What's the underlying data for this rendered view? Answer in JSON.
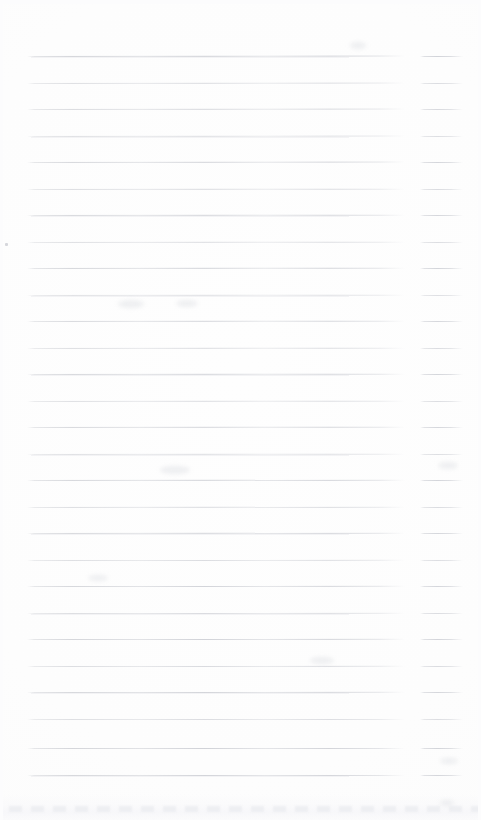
{
  "document": {
    "kind": "scanned-page",
    "description": "Blank ruled notepad page, scanned",
    "page_width": 481,
    "page_height": 820,
    "text_content": "",
    "visible_text": []
  },
  "paper": {
    "background_color": "#fdfdfd",
    "edge_color": "#fcfcfc"
  },
  "ruling": {
    "line_color": "#c9cbd1",
    "ghost_color": "#e2e4e8",
    "line_thickness_px": 1,
    "line_count": 28,
    "first_line_y": 56,
    "line_spacing_px": 26.6,
    "main_segment": {
      "x_start": 27,
      "x_end": 405
    },
    "tail_segment": {
      "x_start": 420,
      "x_end": 463
    },
    "lines": [
      {
        "y": 56,
        "tilt": -1.6,
        "opacity": 0.95,
        "ghost": true
      },
      {
        "y": 83,
        "tilt": -1.4,
        "opacity": 0.72,
        "ghost": false
      },
      {
        "y": 109,
        "tilt": -1.4,
        "opacity": 0.8,
        "ghost": false
      },
      {
        "y": 136,
        "tilt": -1.3,
        "opacity": 0.68,
        "ghost": true
      },
      {
        "y": 162,
        "tilt": -1.3,
        "opacity": 0.88,
        "ghost": false
      },
      {
        "y": 189,
        "tilt": -1.2,
        "opacity": 0.74,
        "ghost": false
      },
      {
        "y": 215,
        "tilt": -1.2,
        "opacity": 0.86,
        "ghost": true
      },
      {
        "y": 242,
        "tilt": -1.1,
        "opacity": 0.7,
        "ghost": false
      },
      {
        "y": 268,
        "tilt": -1.1,
        "opacity": 0.9,
        "ghost": false
      },
      {
        "y": 295,
        "tilt": -1.0,
        "opacity": 0.66,
        "ghost": true
      },
      {
        "y": 321,
        "tilt": -1.0,
        "opacity": 0.84,
        "ghost": false
      },
      {
        "y": 348,
        "tilt": -0.9,
        "opacity": 0.72,
        "ghost": false
      },
      {
        "y": 374,
        "tilt": -0.9,
        "opacity": 0.88,
        "ghost": true
      },
      {
        "y": 401,
        "tilt": -0.8,
        "opacity": 0.7,
        "ghost": false
      },
      {
        "y": 427,
        "tilt": -0.8,
        "opacity": 0.86,
        "ghost": false
      },
      {
        "y": 454,
        "tilt": -0.8,
        "opacity": 0.68,
        "ghost": true
      },
      {
        "y": 480,
        "tilt": -0.7,
        "opacity": 0.9,
        "ghost": false
      },
      {
        "y": 507,
        "tilt": -0.7,
        "opacity": 0.74,
        "ghost": false
      },
      {
        "y": 533,
        "tilt": -0.7,
        "opacity": 0.86,
        "ghost": true
      },
      {
        "y": 560,
        "tilt": -0.6,
        "opacity": 0.7,
        "ghost": false
      },
      {
        "y": 586,
        "tilt": -0.6,
        "opacity": 0.88,
        "ghost": false
      },
      {
        "y": 613,
        "tilt": -0.6,
        "opacity": 0.72,
        "ghost": true
      },
      {
        "y": 639,
        "tilt": -0.5,
        "opacity": 0.9,
        "ghost": false
      },
      {
        "y": 666,
        "tilt": -0.5,
        "opacity": 0.74,
        "ghost": false
      },
      {
        "y": 692,
        "tilt": -0.5,
        "opacity": 0.86,
        "ghost": true
      },
      {
        "y": 719,
        "tilt": -0.4,
        "opacity": 0.7,
        "ghost": false
      },
      {
        "y": 748,
        "tilt": -0.4,
        "opacity": 0.92,
        "ghost": false
      },
      {
        "y": 775,
        "tilt": -0.4,
        "opacity": 0.88,
        "ghost": true
      }
    ]
  },
  "artifacts": {
    "speck": {
      "x": 5,
      "y": 243,
      "w": 3,
      "h": 3
    },
    "smudges": [
      {
        "x": 350,
        "y": 42,
        "w": 16,
        "h": 7
      },
      {
        "x": 118,
        "y": 300,
        "w": 26,
        "h": 8
      },
      {
        "x": 176,
        "y": 300,
        "w": 22,
        "h": 7
      },
      {
        "x": 160,
        "y": 466,
        "w": 30,
        "h": 8
      },
      {
        "x": 438,
        "y": 462,
        "w": 20,
        "h": 7
      },
      {
        "x": 310,
        "y": 657,
        "w": 24,
        "h": 7
      },
      {
        "x": 88,
        "y": 575,
        "w": 20,
        "h": 6
      },
      {
        "x": 440,
        "y": 758,
        "w": 18,
        "h": 6
      },
      {
        "x": 440,
        "y": 800,
        "w": 14,
        "h": 6
      }
    ],
    "bottom_band": {
      "y": 794,
      "height": 26
    }
  }
}
